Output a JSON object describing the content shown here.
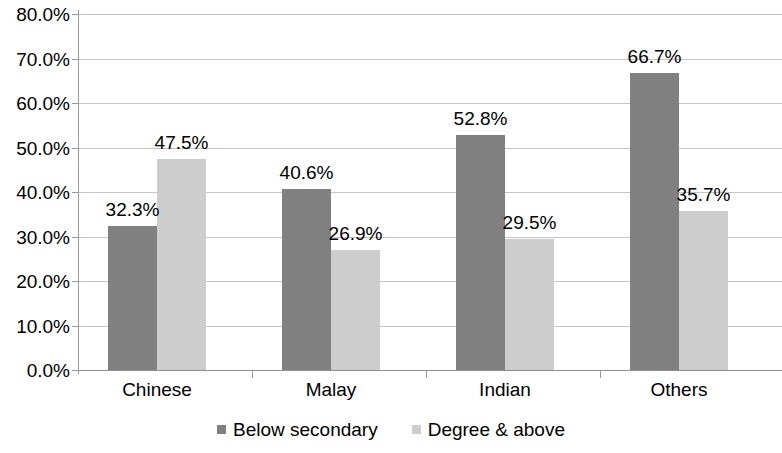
{
  "chart_data": {
    "type": "bar",
    "title": "",
    "subtitle": "",
    "xlabel": "",
    "ylabel": "",
    "categories": [
      "Chinese",
      "Malay",
      "Indian",
      "Others"
    ],
    "series": [
      {
        "name": "Below secondary",
        "color": "#808080",
        "values": [
          32.3,
          40.6,
          52.8,
          66.7
        ],
        "labels": [
          "32.3%",
          "40.6%",
          "52.8%",
          "66.7%"
        ]
      },
      {
        "name": "Degree & above",
        "color": "#cdcdcd",
        "values": [
          47.5,
          26.9,
          29.5,
          35.7
        ],
        "labels": [
          "47.5%",
          "26.9%",
          "29.5%",
          "35.7%"
        ]
      }
    ],
    "ylim": [
      0,
      80
    ],
    "ytick_values": [
      0,
      10,
      20,
      30,
      40,
      50,
      60,
      70,
      80
    ],
    "ytick_labels": [
      "0.0%",
      "10.0%",
      "20.0%",
      "30.0%",
      "40.0%",
      "50.0%",
      "60.0%",
      "70.0%",
      "80.0%"
    ],
    "grid": true,
    "grid_axis": "y",
    "legend_position": "bottom",
    "value_labels_shown": true,
    "background_color": "#ffffff",
    "gridline_color": "#c4c4c4",
    "axis_color": "#9a9a9a",
    "text_color": "#000000"
  },
  "legend": {
    "items": [
      {
        "label": "Below secondary",
        "color": "#808080"
      },
      {
        "label": "Degree & above",
        "color": "#cdcdcd"
      }
    ]
  }
}
